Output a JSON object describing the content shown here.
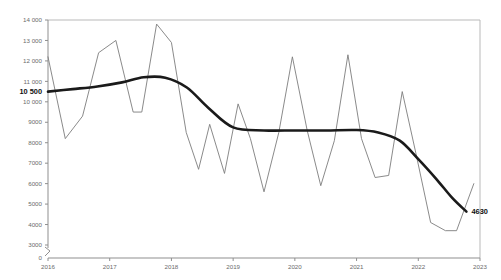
{
  "chart_data": {
    "type": "line",
    "title": "",
    "subtitle": "",
    "xlabel": "",
    "ylabel": "",
    "xlim": [
      2016,
      2023
    ],
    "ylim": [
      3000,
      14000
    ],
    "ybreak_zero_label": "0",
    "grid": false,
    "legend": "none",
    "x_tick_labels": [
      "2016",
      "2017",
      "2018",
      "2019",
      "2020",
      "2021",
      "2022",
      "2023"
    ],
    "x_tick_values": [
      2016,
      2017,
      2018,
      2019,
      2020,
      2021,
      2022,
      2023
    ],
    "y_tick_labels": [
      "14 000",
      "13 000",
      "12 000",
      "11 000",
      "10 000",
      "9000",
      "8000",
      "7000",
      "6000",
      "5000",
      "4000",
      "3000"
    ],
    "y_tick_values": [
      14000,
      13000,
      12000,
      11000,
      10000,
      9000,
      8000,
      7000,
      6000,
      5000,
      4000,
      3000
    ],
    "annotations": [
      {
        "name": "series-start-value",
        "text": "10 500",
        "value": 10500,
        "x": 2016
      },
      {
        "name": "series-end-value",
        "text": "4630",
        "value": 4630,
        "x": 2022.78
      }
    ],
    "series": [
      {
        "name": "seasonal",
        "style": "thin",
        "color": "#7d7d7d",
        "x": [
          2016.0,
          2016.28,
          2016.56,
          2016.82,
          2017.1,
          2017.38,
          2017.52,
          2017.76,
          2018.0,
          2018.24,
          2018.44,
          2018.62,
          2018.86,
          2019.08,
          2019.28,
          2019.5,
          2019.74,
          2019.96,
          2020.2,
          2020.42,
          2020.64,
          2020.86,
          2021.08,
          2021.3,
          2021.52,
          2021.74,
          2021.96,
          2022.2,
          2022.44,
          2022.62,
          2022.9
        ],
        "values": [
          12200,
          8200,
          9300,
          12400,
          13000,
          9500,
          9500,
          13800,
          12900,
          8500,
          6700,
          8900,
          6500,
          9900,
          8200,
          5600,
          8500,
          12200,
          8600,
          5900,
          8100,
          12300,
          8200,
          6300,
          6400,
          10500,
          7500,
          4100,
          3700,
          3700,
          6000
        ]
      },
      {
        "name": "trend",
        "style": "bold",
        "color": "#1a1a1a",
        "x": [
          2016.0,
          2016.4,
          2016.8,
          2017.2,
          2017.55,
          2017.9,
          2018.25,
          2018.6,
          2019.0,
          2019.5,
          2020.0,
          2020.5,
          2021.0,
          2021.35,
          2021.7,
          2022.0,
          2022.3,
          2022.55,
          2022.78
        ],
        "values": [
          10500,
          10620,
          10750,
          10950,
          11200,
          11180,
          10700,
          9700,
          8750,
          8600,
          8600,
          8600,
          8620,
          8500,
          8100,
          7200,
          6200,
          5300,
          4630
        ]
      }
    ]
  }
}
